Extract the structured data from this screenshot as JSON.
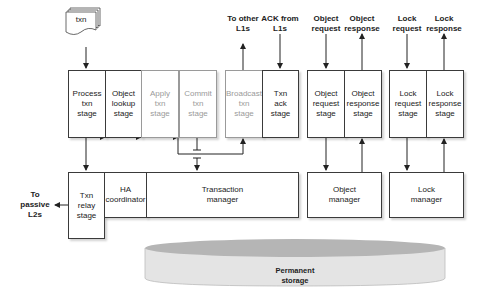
{
  "input_doc": {
    "label": "txn"
  },
  "stages": [
    {
      "id": "process",
      "label": "Process\ntxn\nstage",
      "dim": false
    },
    {
      "id": "lookup",
      "label": "Object\nlookup\nstage",
      "dim": false
    },
    {
      "id": "apply",
      "label": "Apply\ntxn\nstage",
      "dim": true
    },
    {
      "id": "commit",
      "label": "Commit\ntxn\nstage",
      "dim": true
    },
    {
      "id": "broadcast",
      "label": "Broadcast\ntxn\nstage",
      "dim": true
    },
    {
      "id": "ack",
      "label": "Txn\nack\nstage",
      "dim": false
    },
    {
      "id": "obj_req",
      "label": "Object\nrequest\nstage",
      "dim": false
    },
    {
      "id": "obj_resp",
      "label": "Object\nresponse\nstage",
      "dim": false
    },
    {
      "id": "lock_req",
      "label": "Lock\nrequest\nstage",
      "dim": false
    },
    {
      "id": "lock_resp",
      "label": "Lock\nresponse\nstage",
      "dim": false
    }
  ],
  "managers": {
    "relay": "Txn\nrelay\nstage",
    "ha": "HA\ncoordinator",
    "txn": "Transaction\nmanager",
    "object": "Object\nmanager",
    "lock": "Lock\nmanager"
  },
  "external_labels": {
    "to_other_l1s": "To other\nL1s",
    "ack_from_l1s": "ACK from\nL1s",
    "object_request": "Object\nrequest",
    "object_response": "Object\nresponse",
    "lock_request": "Lock\nrequest",
    "lock_response": "Lock\nresponse",
    "to_passive_l2s": "To\npassive\nL2s"
  },
  "storage": {
    "label": "Permanent\nstorage"
  }
}
